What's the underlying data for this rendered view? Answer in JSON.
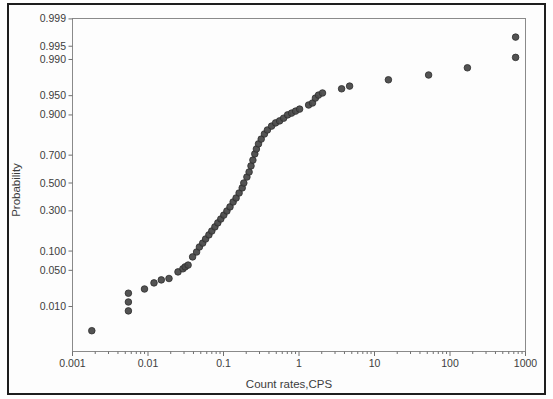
{
  "figure": {
    "border_color": "#1e1e1e",
    "background": "#fdfdfd",
    "frame_color": "#8a8a8a",
    "tick_color": "#6f6f6f",
    "text_color": "#3c3c3c"
  },
  "chart_data": {
    "type": "scatter",
    "title": "",
    "xlabel": "Count rates,CPS",
    "ylabel": "Probability",
    "x_scale": "log",
    "x_range": [
      0.001,
      1000
    ],
    "y_scale": "normal-probability",
    "y_range": [
      0.001,
      0.999
    ],
    "grid": false,
    "legend": false,
    "x_tick_values": [
      0.001,
      0.01,
      0.1,
      1,
      10,
      100,
      1000
    ],
    "x_tick_labels": [
      "0.001",
      "0.01",
      "0.1",
      "1",
      "10",
      "100",
      "1000"
    ],
    "y_tick_values": [
      0.999,
      0.995,
      0.99,
      0.95,
      0.9,
      0.7,
      0.5,
      0.3,
      0.1,
      0.05,
      0.01
    ],
    "y_tick_labels": [
      "0.999",
      "0.995",
      "0.990",
      "0.950",
      "0.900",
      "0.700",
      "0.500",
      "0.300",
      "0.100",
      "0.050",
      "0.010"
    ],
    "marker": {
      "shape": "circle",
      "fill": "#4a4a4a",
      "stroke": "#2d2d2d",
      "radius_px": 3.3
    },
    "points": [
      [
        0.0018,
        0.0027
      ],
      [
        0.0055,
        0.008
      ],
      [
        0.0055,
        0.0125
      ],
      [
        0.0055,
        0.019
      ],
      [
        0.009,
        0.023
      ],
      [
        0.012,
        0.03
      ],
      [
        0.015,
        0.034
      ],
      [
        0.019,
        0.036
      ],
      [
        0.025,
        0.047
      ],
      [
        0.029,
        0.053
      ],
      [
        0.031,
        0.057
      ],
      [
        0.034,
        0.061
      ],
      [
        0.039,
        0.082
      ],
      [
        0.044,
        0.097
      ],
      [
        0.048,
        0.114
      ],
      [
        0.053,
        0.129
      ],
      [
        0.058,
        0.146
      ],
      [
        0.064,
        0.164
      ],
      [
        0.07,
        0.183
      ],
      [
        0.077,
        0.204
      ],
      [
        0.084,
        0.226
      ],
      [
        0.092,
        0.249
      ],
      [
        0.101,
        0.273
      ],
      [
        0.111,
        0.299
      ],
      [
        0.122,
        0.326
      ],
      [
        0.134,
        0.36
      ],
      [
        0.147,
        0.389
      ],
      [
        0.161,
        0.425
      ],
      [
        0.177,
        0.463
      ],
      [
        0.186,
        0.5
      ],
      [
        0.204,
        0.545
      ],
      [
        0.218,
        0.582
      ],
      [
        0.231,
        0.626
      ],
      [
        0.245,
        0.667
      ],
      [
        0.26,
        0.708
      ],
      [
        0.273,
        0.739
      ],
      [
        0.291,
        0.769
      ],
      [
        0.316,
        0.796
      ],
      [
        0.348,
        0.822
      ],
      [
        0.382,
        0.841
      ],
      [
        0.434,
        0.858
      ],
      [
        0.49,
        0.871
      ],
      [
        0.553,
        0.879
      ],
      [
        0.625,
        0.889
      ],
      [
        0.706,
        0.9
      ],
      [
        0.797,
        0.906
      ],
      [
        0.901,
        0.912
      ],
      [
        1.02,
        0.918
      ],
      [
        1.34,
        0.929
      ],
      [
        1.51,
        0.934
      ],
      [
        1.65,
        0.945
      ],
      [
        1.81,
        0.951
      ],
      [
        2.05,
        0.955
      ],
      [
        3.67,
        0.962
      ],
      [
        4.68,
        0.966
      ],
      [
        15.3,
        0.974
      ],
      [
        52.0,
        0.979
      ],
      [
        170,
        0.985
      ],
      [
        740,
        0.991
      ],
      [
        740,
        0.997
      ]
    ]
  }
}
